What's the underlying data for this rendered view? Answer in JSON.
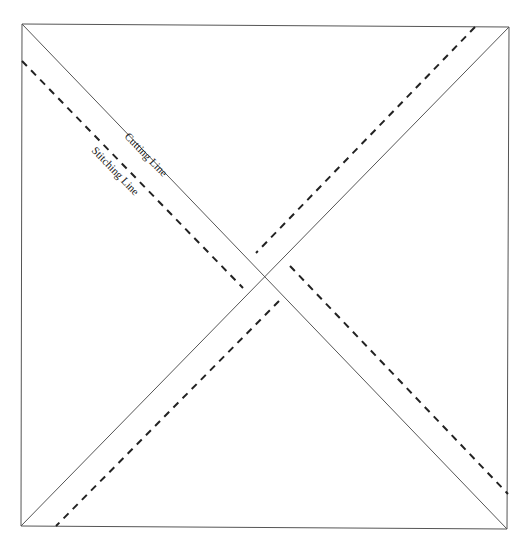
{
  "caption": {
    "text": "Half-Square Triangle Cutting Diagram (cropped)"
  },
  "diagram": {
    "square": {
      "corners": [
        [
          22,
          24
        ],
        [
          509,
          27
        ],
        [
          507,
          529
        ],
        [
          21,
          526
        ]
      ],
      "stroke": "#555555"
    },
    "cutting_lines": [
      {
        "from": [
          22,
          24
        ],
        "to": [
          507,
          529
        ]
      },
      {
        "from": [
          509,
          27
        ],
        "to": [
          21,
          526
        ]
      }
    ],
    "stitching_lines": [
      {
        "from": [
          22,
          61
        ],
        "to": [
          243,
          288
        ]
      },
      {
        "from": [
          475,
          27
        ],
        "to": [
          256,
          253
        ]
      },
      {
        "from": [
          290,
          266
        ],
        "to": [
          508,
          494
        ]
      },
      {
        "from": [
          279,
          301
        ],
        "to": [
          56,
          526
        ]
      }
    ],
    "labels": {
      "cutting": "Cutting Line",
      "stitching": "Stitching Line"
    },
    "colors": {
      "line": "#555555",
      "dash": "#222222",
      "text": "#222222"
    }
  }
}
